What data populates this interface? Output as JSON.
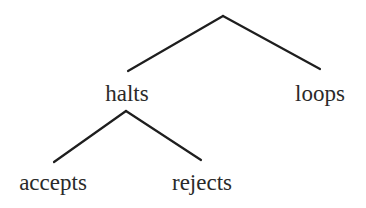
{
  "diagram": {
    "type": "tree",
    "root": {
      "label": "",
      "children": [
        "halts",
        "loops"
      ]
    },
    "nodes": {
      "halts": {
        "label": "halts",
        "children": [
          "accepts",
          "rejects"
        ]
      },
      "loops": {
        "label": "loops",
        "children": []
      },
      "accepts": {
        "label": "accepts",
        "children": []
      },
      "rejects": {
        "label": "rejects",
        "children": []
      }
    },
    "edges": [
      {
        "from": "root",
        "to": "halts"
      },
      {
        "from": "root",
        "to": "loops"
      },
      {
        "from": "halts",
        "to": "accepts"
      },
      {
        "from": "halts",
        "to": "rejects"
      }
    ],
    "colors": {
      "line": "#1e1e1e",
      "text": "#2a2a2a",
      "background": "#ffffff"
    }
  }
}
